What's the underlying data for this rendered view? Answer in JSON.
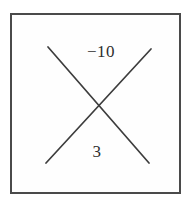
{
  "diagram": {
    "top_value": "−10",
    "bottom_value": "3",
    "line_color": "#3d3d3d",
    "border_color": "#4a4a4a",
    "background": "#fefefe"
  }
}
